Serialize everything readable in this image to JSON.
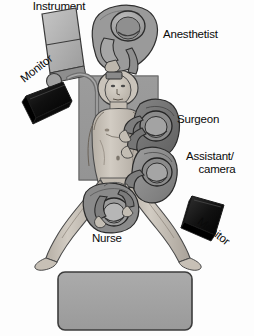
{
  "figure": {
    "background_color": "#fdfdfd",
    "text_color": "#0a0a0a",
    "view": "overhead"
  },
  "labels": {
    "anesthetist": "Anesthetist",
    "surgeon": "Surgeon",
    "assistant_line1": "Assistant/",
    "assistant_line2": "camera",
    "nurse": "Nurse",
    "monitor_left": "Monitor",
    "monitor_right": "Monitor",
    "instrument_table_line1": "Instrument",
    "instrument_table_line2": "table"
  },
  "elements": {
    "patient": {
      "name": "patient",
      "position": "supine on operating table, legs abducted"
    },
    "operating_table": {
      "name": "operating-table",
      "color": "#8c8c8c"
    },
    "anesthesia_machine": {
      "name": "anesthesia-machine",
      "color": "#b3b3b3"
    },
    "monitor_left": {
      "name": "monitor-left",
      "color": "#111111"
    },
    "monitor_right": {
      "name": "monitor-right",
      "color": "#111111"
    },
    "instrument_table": {
      "name": "instrument-table",
      "color": "#a0a0a0",
      "border_color": "#3c3c3c"
    },
    "staff": [
      {
        "role": "Anesthetist",
        "gown_color": "#9a9a9a"
      },
      {
        "role": "Surgeon",
        "gown_color": "#6f6f6f"
      },
      {
        "role": "Assistant/camera",
        "gown_color": "#6f6f6f"
      },
      {
        "role": "Nurse",
        "gown_color": "#8a8a8a"
      }
    ]
  },
  "colors": {
    "skin": "#cfc9c0",
    "skin_shadow": "#a9a299",
    "gown_dark": "#6f6f6f",
    "gown_mid": "#8a8a8a",
    "gown_light": "#9a9a9a",
    "equipment_gray": "#b3b3b3",
    "table_gray": "#a0a0a0",
    "monitor_black": "#111111",
    "outline": "#2b2b2b"
  }
}
